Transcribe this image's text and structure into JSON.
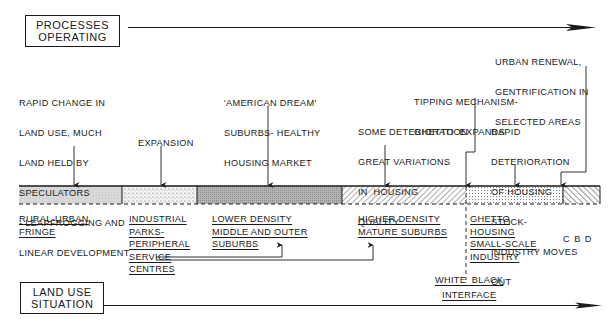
{
  "headers": {
    "processes": [
      "PROCESSES",
      "OPERATING"
    ],
    "land_use": [
      "LAND USE",
      "SITUATION"
    ]
  },
  "processes": [
    {
      "id": "rapid-change",
      "lines": [
        "RAPID CHANGE IN",
        "LAND USE, MUCH",
        "LAND HELD BY",
        "SPECULATORS",
        "- LEAPFROGGING AND",
        "LINEAR DEVELOPMENT"
      ]
    },
    {
      "id": "expansion",
      "lines": [
        "EXPANSION"
      ]
    },
    {
      "id": "american-dream",
      "lines": [
        "'AMERICAN DREAM'",
        "SUBURBS- HEALTHY",
        "HOUSING MARKET"
      ]
    },
    {
      "id": "some-deterioration",
      "lines": [
        "SOME DETERIORATION",
        "GREAT VARIATIONS",
        "IN  HOUSING",
        "QUALITY"
      ]
    },
    {
      "id": "tipping-mechanism",
      "lines": [
        "TIPPING MECHANISM-",
        "GHETTO  EXPANDS"
      ]
    },
    {
      "id": "rapid-deterioration",
      "lines": [
        "RAPID",
        "DETERIORATION",
        "OF HOUSING",
        "STOCK-",
        "INDUSTRY MOVES",
        "OUT"
      ]
    },
    {
      "id": "urban-renewal",
      "lines": [
        "URBAN RENEWAL,",
        "GENTRIFICATION IN",
        "SELECTED AREAS"
      ]
    }
  ],
  "zones": [
    {
      "id": "rural-urban-fringe",
      "pattern": "light-grey",
      "lines": [
        "RURAL-URBAN",
        "FRINGE"
      ]
    },
    {
      "id": "industrial-parks",
      "pattern": "stipple",
      "lines": [
        "INDUSTRIAL",
        "PARKS-",
        "PERIPHERAL",
        "SERVICE",
        "CENTRES"
      ]
    },
    {
      "id": "lower-density",
      "pattern": "dark-grey",
      "lines": [
        "LOWER DENSITY",
        "MIDDLE AND OUTER",
        "SUBURBS"
      ]
    },
    {
      "id": "higher-density",
      "pattern": "hatch-backslash",
      "lines": [
        "HIGHER DENSITY",
        "MATURE SUBURBS"
      ]
    },
    {
      "id": "ghetto",
      "pattern": "dot-grid",
      "lines": [
        "GHETTO",
        "HOUSING",
        "SMALL-SCALE",
        "INDUSTRY"
      ]
    },
    {
      "id": "cbd",
      "pattern": "hatch-slash",
      "lines": [
        "C B D"
      ]
    }
  ],
  "interface_label": [
    "WHITE  BLACK",
    "INTERFACE"
  ],
  "colors": {
    "ink": "#1a1a1a",
    "light_grey": "#d4d4d4",
    "dark_grey": "#a8a8a8"
  }
}
